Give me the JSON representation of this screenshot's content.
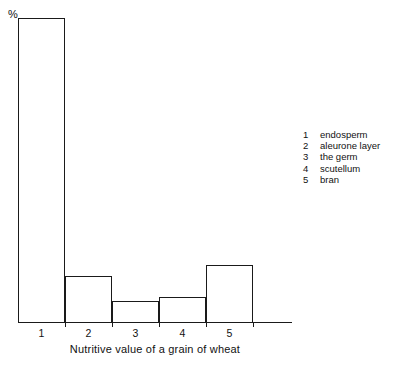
{
  "chart_data": {
    "type": "bar",
    "title": "",
    "subtitle": "",
    "xlabel": "Nutritive value of a grain of wheat",
    "ylabel": "%",
    "categories": [
      "1",
      "2",
      "3",
      "4",
      "5"
    ],
    "values": [
      100,
      15,
      6.8,
      8.2,
      18.6
    ],
    "ylim": [
      0,
      100
    ],
    "grid": false,
    "legend_position": "right",
    "legend": [
      {
        "key": "1",
        "label": "endosperm"
      },
      {
        "key": "2",
        "label": "aleurone layer"
      },
      {
        "key": "3",
        "label": "the germ"
      },
      {
        "key": "4",
        "label": "scutellum"
      },
      {
        "key": "5",
        "label": "bran"
      }
    ],
    "series": [
      {
        "name": "Nutritive value",
        "values": [
          100,
          15,
          6.8,
          8.2,
          18.6
        ]
      }
    ],
    "colors": {
      "axis": "#1a1a1a",
      "bar_stroke": "#1a1a1a",
      "bar_fill": "#ffffff",
      "background": "#ffffff",
      "text": "#111111"
    }
  }
}
